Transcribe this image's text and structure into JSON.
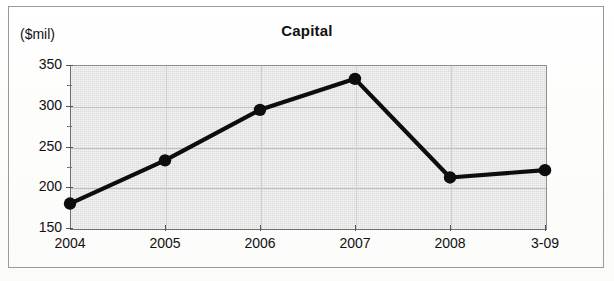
{
  "figure": {
    "title": "Capital",
    "y_unit_label": "($mil)"
  },
  "chart_data": {
    "type": "line",
    "title": "Capital",
    "xlabel": "",
    "ylabel": "($mil)",
    "categories": [
      "2004",
      "2005",
      "2006",
      "2007",
      "2008",
      "3-09"
    ],
    "values": [
      180,
      233,
      295,
      333,
      212,
      221
    ],
    "ylim": [
      150,
      350
    ],
    "y_major_ticks": [
      150,
      200,
      250,
      300,
      350
    ],
    "y_minor_ticks": [
      175,
      225,
      275,
      325
    ],
    "y_tick_labels": [
      "150",
      "200",
      "250",
      "300",
      "350"
    ],
    "grid": true,
    "legend": false,
    "series": [
      {
        "name": "Capital",
        "values": [
          180,
          233,
          295,
          333,
          212,
          221
        ],
        "line_color": "#0d0d0d",
        "marker": "circle",
        "marker_color": "#0d0d0d"
      }
    ],
    "colors": {
      "plot_background": "#dcdcdc",
      "line": "#0d0d0d",
      "gridline": "#c0c0c0",
      "axis": "#555555",
      "text": "#111111",
      "page_background": "#fdfdfc",
      "frame_border": "#9a9a9a"
    }
  }
}
